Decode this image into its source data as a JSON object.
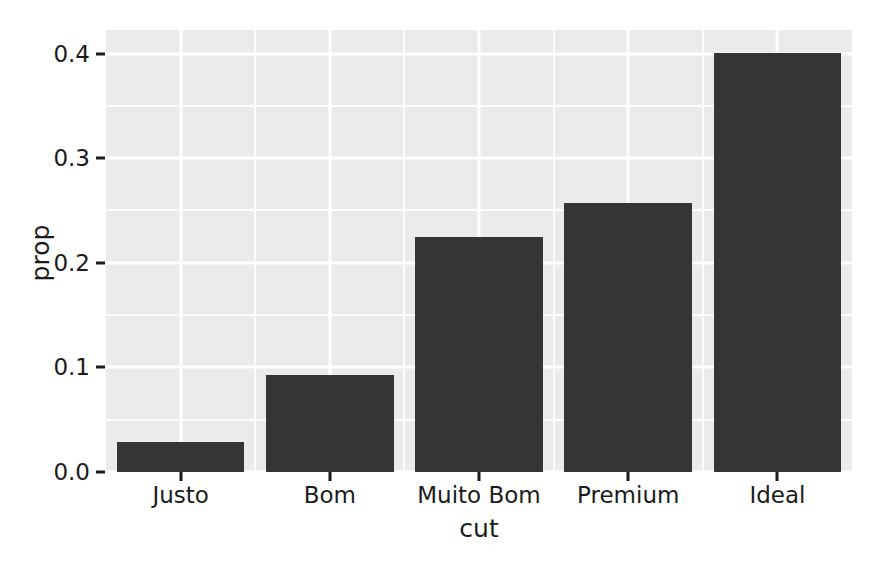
{
  "chart_data": {
    "type": "bar",
    "title": "",
    "subtitle": "",
    "xlabel": "cut",
    "ylabel": "prop",
    "categories": [
      "Justo",
      "Bom",
      "Muito Bom",
      "Premium",
      "Ideal"
    ],
    "values": [
      0.029,
      0.093,
      0.225,
      0.257,
      0.401
    ],
    "series": [
      {
        "name": "prop",
        "values": [
          0.029,
          0.093,
          0.225,
          0.257,
          0.401
        ]
      }
    ],
    "ylim": [
      0.0,
      0.4225
    ],
    "ytick_labels": [
      "0.0",
      "0.1",
      "0.2",
      "0.3",
      "0.4"
    ],
    "ytick_values": [
      0.0,
      0.1,
      0.2,
      0.3,
      0.4
    ],
    "yminor_values": [
      0.05,
      0.15,
      0.25,
      0.35
    ],
    "grid": true,
    "grid_major_color": "#ffffff",
    "grid_minor_color": "#ffffff",
    "legend": "none",
    "legend_position": "none",
    "bar_color": "#353535",
    "panel_background": "#ebebeb",
    "plot_background": "#ffffff",
    "text_color": "#1b1b1b",
    "annotations": []
  }
}
